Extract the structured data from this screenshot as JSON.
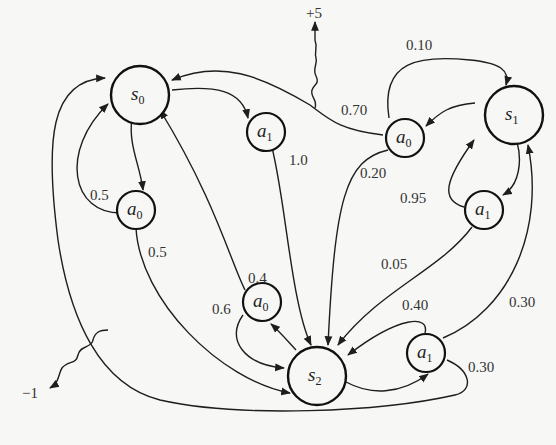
{
  "diagram": {
    "type": "Markov Decision Process",
    "nodes": {
      "s0": {
        "label": "s",
        "sub": "0",
        "kind": "state"
      },
      "s1": {
        "label": "s",
        "sub": "1",
        "kind": "state"
      },
      "s2": {
        "label": "s",
        "sub": "2",
        "kind": "state"
      },
      "s0_a0": {
        "label": "a",
        "sub": "0",
        "kind": "action",
        "from": "s0"
      },
      "s0_a1": {
        "label": "a",
        "sub": "1",
        "kind": "action",
        "from": "s0"
      },
      "s1_a0": {
        "label": "a",
        "sub": "0",
        "kind": "action",
        "from": "s1"
      },
      "s1_a1": {
        "label": "a",
        "sub": "1",
        "kind": "action",
        "from": "s1"
      },
      "s2_a0": {
        "label": "a",
        "sub": "0",
        "kind": "action",
        "from": "s2"
      },
      "s2_a1": {
        "label": "a",
        "sub": "1",
        "kind": "action",
        "from": "s2"
      }
    },
    "transitions": [
      {
        "from": "s0_a0",
        "to": "s0",
        "p": "0.5"
      },
      {
        "from": "s0_a0",
        "to": "s2",
        "p": "0.5"
      },
      {
        "from": "s0_a1",
        "to": "s2",
        "p": "1.0"
      },
      {
        "from": "s1_a0",
        "to": "s0",
        "p": "0.70"
      },
      {
        "from": "s1_a0",
        "to": "s1",
        "p": "0.10"
      },
      {
        "from": "s1_a0",
        "to": "s2",
        "p": "0.20"
      },
      {
        "from": "s1_a1",
        "to": "s1",
        "p": "0.95"
      },
      {
        "from": "s1_a1",
        "to": "s2",
        "p": "0.05"
      },
      {
        "from": "s2_a0",
        "to": "s0",
        "p": "0.4"
      },
      {
        "from": "s2_a0",
        "to": "s2",
        "p": "0.6"
      },
      {
        "from": "s2_a1",
        "to": "s0",
        "p": "0.30"
      },
      {
        "from": "s2_a1",
        "to": "s1",
        "p": "0.30"
      },
      {
        "from": "s2_a1",
        "to": "s2",
        "p": "0.40"
      }
    ],
    "rewards": [
      {
        "on": "s1_a0 -> s0",
        "value": "+5"
      },
      {
        "on": "s2_a1 -> s0",
        "value": "−1"
      }
    ]
  },
  "labels": {
    "s0": "s",
    "s0_sub": "0",
    "s1": "s",
    "s1_sub": "1",
    "s2": "s",
    "s2_sub": "2",
    "a": "a",
    "sub0": "0",
    "sub1": "1",
    "p_s0a0_s0": "0.5",
    "p_s0a0_s2": "0.5",
    "p_s0a1_s2": "1.0",
    "p_s1a0_s0": "0.70",
    "p_s1a0_s1": "0.10",
    "p_s1a0_s2": "0.20",
    "p_s1a1_s1": "0.95",
    "p_s1a1_s2": "0.05",
    "p_s2a0_s0": "0.4",
    "p_s2a0_s2": "0.6",
    "p_s2a1_s2": "0.40",
    "p_s2a1_s1": "0.30",
    "p_s2a1_s0": "0.30",
    "reward_plus": "+5",
    "reward_minus": "−1"
  }
}
